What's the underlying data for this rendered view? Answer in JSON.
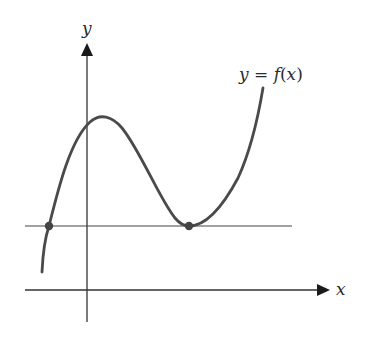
{
  "diagram": {
    "type": "function-graph",
    "axes": {
      "x_label": "x",
      "y_label": "y"
    },
    "curve_label": {
      "y": "y",
      "eq": " = ",
      "f": "f",
      "open": "(",
      "x": "x",
      "close": ")"
    },
    "colors": {
      "axis": "#333333",
      "curve": "#4a4a4a",
      "point": "#444444",
      "background": "#ffffff"
    },
    "marked_points": [
      {
        "name": "left-intersection",
        "description": "curve crosses horizontal line"
      },
      {
        "name": "right-tangent-point",
        "description": "curve touches horizontal line at local minimum"
      }
    ]
  }
}
